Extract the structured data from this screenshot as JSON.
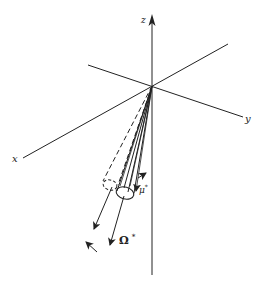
{
  "figure": {
    "axes": {
      "z": {
        "label": "z"
      },
      "y": {
        "label": "y"
      },
      "x": {
        "label": "x"
      }
    },
    "vectors": {
      "mu": {
        "label": "μ",
        "superscript": "*"
      },
      "omega": {
        "label": "Ω",
        "superscript": "*"
      }
    },
    "colors": {
      "ink": "#222222",
      "background": "#ffffff"
    }
  }
}
